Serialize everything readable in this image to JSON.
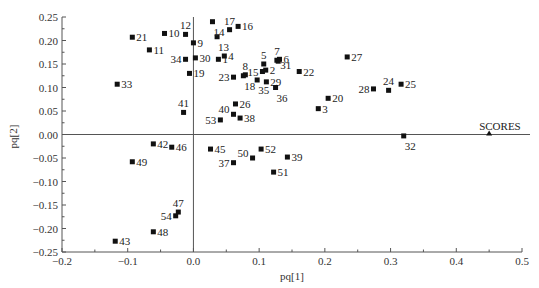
{
  "chart_data": {
    "type": "scatter",
    "title": "",
    "xlabel": "pq[1]",
    "ylabel": "pq[2]",
    "xlim": [
      -0.2,
      0.5
    ],
    "ylim": [
      -0.25,
      0.25
    ],
    "xticks": [
      -0.2,
      -0.1,
      0.0,
      0.1,
      0.2,
      0.3,
      0.4,
      0.5
    ],
    "xtick_labels": [
      "-0.2",
      "-0.1",
      "0.0",
      "0.1",
      "0.2",
      "0.3",
      "0.4",
      "0.5"
    ],
    "yticks": [
      0.25,
      0.2,
      0.15,
      0.1,
      0.05,
      0.0,
      -0.05,
      -0.1,
      -0.15,
      -0.2,
      -0.25
    ],
    "ytick_labels": [
      "0.25",
      "0.20",
      "0.15",
      "0.10",
      "0.05",
      "0.00",
      "-0.05",
      "-0.10",
      "-0.15",
      "-0.20",
      "-0.25"
    ],
    "grid": false,
    "reference_lines": {
      "x": 0.0,
      "y": 0.0
    },
    "series": [
      {
        "name": "samples",
        "marker": "square",
        "points": [
          {
            "label": "1",
            "x": 0.038,
            "y": 0.16,
            "lpos": "r"
          },
          {
            "label": "2",
            "x": 0.11,
            "y": 0.137,
            "lpos": "r"
          },
          {
            "label": "3",
            "x": 0.19,
            "y": 0.055,
            "lpos": "r"
          },
          {
            "label": "4",
            "x": 0.047,
            "y": 0.167,
            "lpos": "r"
          },
          {
            "label": "5",
            "x": 0.107,
            "y": 0.15,
            "lpos": "t"
          },
          {
            "label": "6",
            "x": 0.131,
            "y": 0.16,
            "lpos": "r"
          },
          {
            "label": "7",
            "x": 0.127,
            "y": 0.158,
            "lpos": "t"
          },
          {
            "label": "8",
            "x": 0.079,
            "y": 0.127,
            "lpos": "t"
          },
          {
            "label": "9",
            "x": 0.0,
            "y": 0.195,
            "lpos": "r"
          },
          {
            "label": "10",
            "x": -0.044,
            "y": 0.215,
            "lpos": "r"
          },
          {
            "label": "11",
            "x": -0.067,
            "y": 0.18,
            "lpos": "r"
          },
          {
            "label": "12",
            "x": -0.012,
            "y": 0.213,
            "lpos": "t"
          },
          {
            "label": "13",
            "x": 0.036,
            "y": 0.208,
            "lpos": "b"
          },
          {
            "label": "14",
            "x": 0.029,
            "y": 0.24,
            "lpos": "b"
          },
          {
            "label": "15",
            "x": 0.105,
            "y": 0.134,
            "lpos": "l"
          },
          {
            "label": "16",
            "x": 0.068,
            "y": 0.23,
            "lpos": "r"
          },
          {
            "label": "17",
            "x": 0.055,
            "y": 0.223,
            "lpos": "t"
          },
          {
            "label": "18",
            "x": 0.076,
            "y": 0.125,
            "lpos": "b"
          },
          {
            "label": "19",
            "x": -0.006,
            "y": 0.13,
            "lpos": "r"
          },
          {
            "label": "20",
            "x": 0.205,
            "y": 0.077,
            "lpos": "r"
          },
          {
            "label": "21",
            "x": -0.093,
            "y": 0.207,
            "lpos": "r"
          },
          {
            "label": "22",
            "x": 0.161,
            "y": 0.134,
            "lpos": "r"
          },
          {
            "label": "23",
            "x": 0.061,
            "y": 0.122,
            "lpos": "l"
          },
          {
            "label": "24",
            "x": 0.297,
            "y": 0.094,
            "lpos": "t"
          },
          {
            "label": "25",
            "x": 0.316,
            "y": 0.107,
            "lpos": "r"
          },
          {
            "label": "26",
            "x": 0.064,
            "y": 0.065,
            "lpos": "r"
          },
          {
            "label": "27",
            "x": 0.234,
            "y": 0.165,
            "lpos": "r"
          },
          {
            "label": "28",
            "x": 0.274,
            "y": 0.097,
            "lpos": "l"
          },
          {
            "label": "29",
            "x": 0.111,
            "y": 0.112,
            "lpos": "r"
          },
          {
            "label": "30",
            "x": 0.003,
            "y": 0.163,
            "lpos": "r"
          },
          {
            "label": "31",
            "x": 0.129,
            "y": 0.156,
            "lpos": "br"
          },
          {
            "label": "32",
            "x": 0.32,
            "y": -0.003,
            "lpos": "b"
          },
          {
            "label": "33",
            "x": -0.116,
            "y": 0.107,
            "lpos": "r"
          },
          {
            "label": "34",
            "x": -0.012,
            "y": 0.16,
            "lpos": "l"
          },
          {
            "label": "35",
            "x": 0.097,
            "y": 0.116,
            "lpos": "b"
          },
          {
            "label": "36",
            "x": 0.125,
            "y": 0.1,
            "lpos": "b"
          },
          {
            "label": "37",
            "x": 0.061,
            "y": -0.06,
            "lpos": "l"
          },
          {
            "label": "38",
            "x": 0.071,
            "y": 0.035,
            "lpos": "r"
          },
          {
            "label": "39",
            "x": 0.143,
            "y": -0.048,
            "lpos": "r"
          },
          {
            "label": "40",
            "x": 0.061,
            "y": 0.043,
            "lpos": "tl"
          },
          {
            "label": "41",
            "x": -0.015,
            "y": 0.047,
            "lpos": "t"
          },
          {
            "label": "42",
            "x": -0.061,
            "y": -0.02,
            "lpos": "r"
          },
          {
            "label": "43",
            "x": -0.119,
            "y": -0.227,
            "lpos": "r"
          },
          {
            "label": "45",
            "x": 0.026,
            "y": -0.031,
            "lpos": "r"
          },
          {
            "label": "46",
            "x": -0.033,
            "y": -0.027,
            "lpos": "r"
          },
          {
            "label": "47",
            "x": -0.023,
            "y": -0.165,
            "lpos": "t"
          },
          {
            "label": "48",
            "x": -0.061,
            "y": -0.207,
            "lpos": "r"
          },
          {
            "label": "49",
            "x": -0.093,
            "y": -0.058,
            "lpos": "r"
          },
          {
            "label": "50",
            "x": 0.09,
            "y": -0.05,
            "lpos": "tl"
          },
          {
            "label": "51",
            "x": 0.122,
            "y": -0.08,
            "lpos": "r"
          },
          {
            "label": "52",
            "x": 0.103,
            "y": -0.031,
            "lpos": "r"
          },
          {
            "label": "53",
            "x": 0.041,
            "y": 0.031,
            "lpos": "l"
          },
          {
            "label": "54",
            "x": -0.027,
            "y": -0.173,
            "lpos": "l"
          }
        ]
      },
      {
        "name": "SCORES",
        "marker": "triangle",
        "points": [
          {
            "label": "SCORES",
            "x": 0.45,
            "y": 0.0,
            "lpos": "t"
          }
        ]
      }
    ],
    "caption": "",
    "colors": {
      "axis": "#555555",
      "marker": "#111111",
      "text": "#222222"
    }
  },
  "plot_area": {
    "left": 62,
    "right": 522,
    "top": 17,
    "bottom": 252
  }
}
